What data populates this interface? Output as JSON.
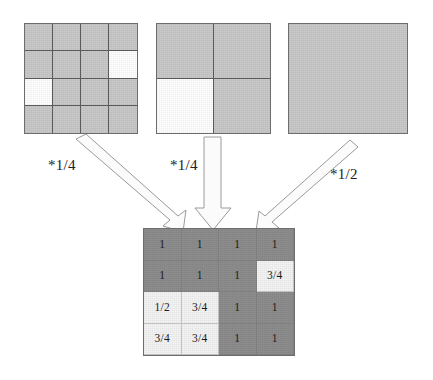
{
  "figure": {
    "background_color": "#ffffff",
    "fill_gray": "#c9c9c9",
    "fill_dark": "#8d8d8d",
    "fill_light": "#f4f4f4",
    "fill_white": "#ffffff",
    "line_color": "#6d6d6d",
    "arrow_fill": "#fbfbfb",
    "arrow_stroke": "#9a9a9a"
  },
  "inputs": [
    {
      "name": "grid-4x4",
      "rows": 4,
      "cols": 4,
      "weight_label": "*1/4",
      "cells": [
        [
          "gray",
          "gray",
          "gray",
          "gray"
        ],
        [
          "gray",
          "gray",
          "gray",
          "white"
        ],
        [
          "white",
          "gray",
          "gray",
          "gray"
        ],
        [
          "gray",
          "gray",
          "gray",
          "gray"
        ]
      ]
    },
    {
      "name": "grid-2x2",
      "rows": 2,
      "cols": 2,
      "weight_label": "*1/4",
      "cells": [
        [
          "gray",
          "gray"
        ],
        [
          "white",
          "gray"
        ]
      ]
    },
    {
      "name": "grid-1x1",
      "rows": 1,
      "cols": 1,
      "weight_label": "*1/2",
      "cells": [
        [
          "gray"
        ]
      ]
    }
  ],
  "result": {
    "name": "result-grid-4x4",
    "rows": 4,
    "cols": 4,
    "values": [
      [
        "1",
        "1",
        "1",
        "1"
      ],
      [
        "1",
        "1",
        "1",
        "3/4"
      ],
      [
        "1/2",
        "3/4",
        "1",
        "1"
      ],
      [
        "3/4",
        "3/4",
        "1",
        "1"
      ]
    ],
    "shades": [
      [
        "dark",
        "dark",
        "dark",
        "dark"
      ],
      [
        "dark",
        "dark",
        "dark",
        "light"
      ],
      [
        "light",
        "light",
        "dark",
        "dark"
      ],
      [
        "light",
        "light",
        "dark",
        "dark"
      ]
    ]
  },
  "arrows": [
    {
      "name": "arrow-from-grid-4x4",
      "direction": "down-right"
    },
    {
      "name": "arrow-from-grid-2x2",
      "direction": "down"
    },
    {
      "name": "arrow-from-grid-1x1",
      "direction": "down-left"
    }
  ]
}
